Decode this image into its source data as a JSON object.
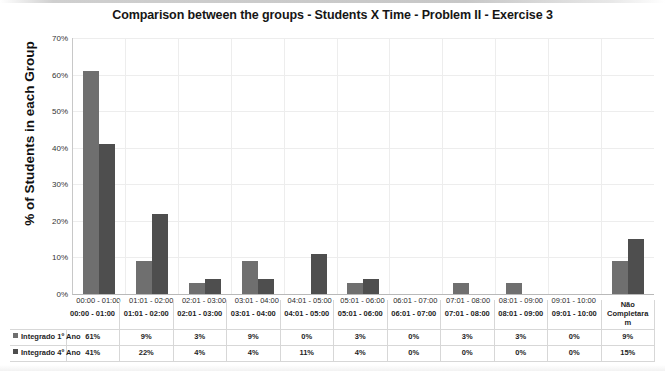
{
  "chart_data": {
    "type": "bar",
    "title": "Comparison between the groups - Students X Time - Problem II - Exercise 3",
    "xlabel": "",
    "ylabel": "% of Students in each Group",
    "ylim": [
      0,
      70
    ],
    "ytick_labels": [
      "70%",
      "60%",
      "50%",
      "40%",
      "30%",
      "20%",
      "10%",
      "0%"
    ],
    "ytick_values": [
      70,
      60,
      50,
      40,
      30,
      20,
      10,
      0
    ],
    "grid": true,
    "legend_position": "bottom-table",
    "categories": [
      "00:00 - 01:00",
      "01:01 - 02:00",
      "02:01 - 03:00",
      "03:01 - 04:00",
      "04:01 - 05:00",
      "05:01 - 06:00",
      "06:01 - 07:00",
      "07:01 - 08:00",
      "08:01 - 09:00",
      "09:01 - 10:00",
      "Não Completaram"
    ],
    "series": [
      {
        "name": "Integrado 1º Ano",
        "color": "#6f6f6f",
        "values": [
          61,
          9,
          3,
          9,
          0,
          3,
          0,
          3,
          3,
          0,
          9
        ],
        "labels": [
          "61%",
          "9%",
          "3%",
          "9%",
          "0%",
          "3%",
          "0%",
          "3%",
          "3%",
          "0%",
          "9%"
        ]
      },
      {
        "name": "Integrado 4º Ano",
        "color": "#4e4e4e",
        "values": [
          41,
          22,
          4,
          4,
          11,
          4,
          0,
          0,
          0,
          0,
          15
        ],
        "labels": [
          "41%",
          "22%",
          "4%",
          "4%",
          "11%",
          "4%",
          "0%",
          "0%",
          "0%",
          "0%",
          "15%"
        ]
      }
    ]
  }
}
